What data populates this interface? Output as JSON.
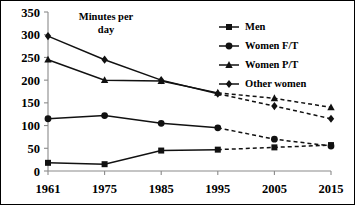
{
  "chart_data": {
    "type": "line",
    "title": "",
    "axis_note": "Minutes per day",
    "axis_note_lines": [
      "Minutes per",
      "day"
    ],
    "xlabel": "",
    "ylabel": "",
    "categories": [
      "1961",
      "1975",
      "1985",
      "1995",
      "2005",
      "2015"
    ],
    "x": [
      1961,
      1975,
      1985,
      1995,
      2005,
      2015
    ],
    "ylim": [
      0,
      350
    ],
    "xlim": [
      1961,
      2015
    ],
    "yticks": [
      0,
      50,
      100,
      150,
      200,
      250,
      300,
      350
    ],
    "ytick_labels": [
      "0",
      "50",
      "100",
      "150",
      "200",
      "250",
      "300",
      "350"
    ],
    "xtick_labels": [
      "1961",
      "1975",
      "1985",
      "1995",
      "2005",
      "2015"
    ],
    "grid": false,
    "legend_position": "top-right",
    "projection_note": "Values from 1995 to 2015 are shown as dashed projections",
    "series": [
      {
        "name": "Men",
        "marker": "square",
        "values": [
          18,
          15,
          45,
          47,
          52,
          57
        ],
        "solid_through_index": 3
      },
      {
        "name": "Women F/T",
        "marker": "circle",
        "values": [
          115,
          122,
          105,
          95,
          70,
          55
        ],
        "solid_through_index": 3
      },
      {
        "name": "Women P/T",
        "marker": "triangle",
        "values": [
          245,
          200,
          198,
          172,
          160,
          140
        ],
        "solid_through_index": 3
      },
      {
        "name": "Other women",
        "marker": "diamond",
        "values": [
          297,
          245,
          200,
          170,
          143,
          115
        ],
        "solid_through_index": 3
      }
    ]
  },
  "legend": {
    "items": [
      {
        "label": "Men",
        "marker": "square"
      },
      {
        "label": "Women F/T",
        "marker": "circle"
      },
      {
        "label": "Women P/T",
        "marker": "triangle"
      },
      {
        "label": "Other women",
        "marker": "diamond"
      }
    ]
  },
  "colors": {
    "series": "#111111",
    "axis": "#8a8a8a",
    "text": "#000000",
    "background": "#ffffff",
    "border": "#000000"
  }
}
